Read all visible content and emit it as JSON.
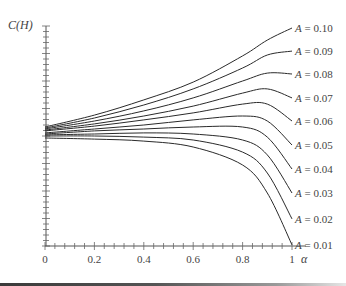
{
  "chart_data": {
    "type": "line",
    "title": "",
    "xlabel": "α",
    "ylabel": "C(H)",
    "xlim": [
      0,
      1
    ],
    "ylim_note": "y values normalized 0 (axis bottom) to 1 (axis top); no numeric y tick labels shown",
    "ylim": [
      0,
      1
    ],
    "x_ticks": [
      "0",
      "0.2",
      "0.4",
      "0.6",
      "0.8",
      "1"
    ],
    "x_minor_tick_step": 0.04,
    "y_minor_ticks": 40,
    "grid": false,
    "legend": "inline labels at right end of each curve",
    "x": [
      0,
      0.2,
      0.4,
      0.6,
      0.8,
      0.9,
      1.0
    ],
    "series": [
      {
        "name": "A = 0.10",
        "values": [
          0.541,
          0.595,
          0.664,
          0.745,
          0.864,
          0.936,
          0.991
        ]
      },
      {
        "name": "A = 0.09",
        "values": [
          0.536,
          0.582,
          0.641,
          0.714,
          0.809,
          0.868,
          0.886
        ]
      },
      {
        "name": "A = 0.08",
        "values": [
          0.532,
          0.568,
          0.614,
          0.673,
          0.75,
          0.786,
          0.782
        ]
      },
      {
        "name": "A = 0.07",
        "values": [
          0.527,
          0.555,
          0.591,
          0.636,
          0.695,
          0.714,
          0.673
        ]
      },
      {
        "name": "A = 0.06",
        "values": [
          0.523,
          0.545,
          0.573,
          0.605,
          0.645,
          0.645,
          0.568
        ]
      },
      {
        "name": "A = 0.05",
        "values": [
          0.514,
          0.532,
          0.55,
          0.573,
          0.591,
          0.568,
          0.459
        ]
      },
      {
        "name": "A = 0.04",
        "values": [
          0.509,
          0.523,
          0.532,
          0.541,
          0.541,
          0.495,
          0.35
        ]
      },
      {
        "name": "A = 0.03",
        "values": [
          0.505,
          0.509,
          0.514,
          0.509,
          0.482,
          0.414,
          0.241
        ]
      },
      {
        "name": "A = 0.02",
        "values": [
          0.5,
          0.5,
          0.495,
          0.482,
          0.427,
          0.332,
          0.123
        ]
      },
      {
        "name": "A = 0.01",
        "values": [
          0.491,
          0.486,
          0.477,
          0.45,
          0.368,
          0.241,
          0.005
        ]
      }
    ]
  },
  "axes": {
    "y_label": "C(H)",
    "x_label": "α",
    "x_tick_labels": [
      "0",
      "0.2",
      "0.4",
      "0.6",
      "0.8",
      "1"
    ]
  }
}
